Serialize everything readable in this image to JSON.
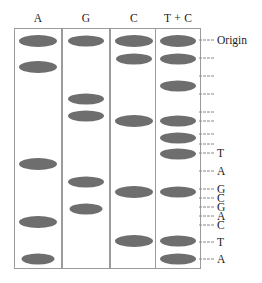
{
  "figure": {
    "type": "dna-sequencing-gel-autoradiogram",
    "band_color": "#6e6e6e",
    "lane_border_color": "#9b9b9b",
    "tick_color": "#8a8a8a",
    "origin_label": "Origin"
  },
  "lanes": [
    {
      "id": "lane-a",
      "header": "A",
      "x": 14,
      "width": 48,
      "bands": [
        {
          "y": 40,
          "w": 38,
          "h": 12
        },
        {
          "y": 66,
          "w": 38,
          "h": 12
        },
        {
          "y": 163,
          "w": 38,
          "h": 12
        },
        {
          "y": 221,
          "w": 38,
          "h": 12
        },
        {
          "y": 258,
          "w": 33,
          "h": 11
        }
      ]
    },
    {
      "id": "lane-g",
      "header": "G",
      "x": 62,
      "width": 48,
      "bands": [
        {
          "y": 40,
          "w": 36,
          "h": 11
        },
        {
          "y": 98,
          "w": 36,
          "h": 11
        },
        {
          "y": 115,
          "w": 36,
          "h": 11
        },
        {
          "y": 181,
          "w": 36,
          "h": 11
        },
        {
          "y": 208,
          "w": 33,
          "h": 11
        }
      ]
    },
    {
      "id": "lane-c",
      "header": "C",
      "x": 110,
      "width": 48,
      "bands": [
        {
          "y": 40,
          "w": 38,
          "h": 12
        },
        {
          "y": 58,
          "w": 36,
          "h": 11
        },
        {
          "y": 120,
          "w": 38,
          "h": 12
        },
        {
          "y": 191,
          "w": 38,
          "h": 12
        },
        {
          "y": 240,
          "w": 38,
          "h": 12
        }
      ]
    },
    {
      "id": "lane-tc",
      "header": "T + C",
      "x": 155,
      "width": 46,
      "bands": [
        {
          "y": 40,
          "w": 36,
          "h": 12
        },
        {
          "y": 58,
          "w": 36,
          "h": 11
        },
        {
          "y": 85,
          "w": 36,
          "h": 11
        },
        {
          "y": 120,
          "w": 36,
          "h": 11
        },
        {
          "y": 137,
          "w": 36,
          "h": 11
        },
        {
          "y": 153,
          "w": 36,
          "h": 11
        },
        {
          "y": 191,
          "w": 36,
          "h": 11
        },
        {
          "y": 240,
          "w": 36,
          "h": 11
        },
        {
          "y": 258,
          "w": 36,
          "h": 11
        }
      ]
    }
  ],
  "ruler": {
    "ticks": [
      {
        "y": 40,
        "label": "Origin"
      },
      {
        "y": 58,
        "label": ""
      },
      {
        "y": 76,
        "label": ""
      },
      {
        "y": 94,
        "label": ""
      },
      {
        "y": 112,
        "label": ""
      },
      {
        "y": 121,
        "label": ""
      },
      {
        "y": 134,
        "label": ""
      },
      {
        "y": 144,
        "label": ""
      },
      {
        "y": 153,
        "label": "T"
      },
      {
        "y": 171,
        "label": "A"
      },
      {
        "y": 189,
        "label": "G"
      },
      {
        "y": 198,
        "label": "C"
      },
      {
        "y": 207,
        "label": "G"
      },
      {
        "y": 216,
        "label": "A"
      },
      {
        "y": 225,
        "label": "C"
      },
      {
        "y": 242,
        "label": "T"
      },
      {
        "y": 259,
        "label": "A"
      }
    ],
    "sequence_read": [
      "T",
      "A",
      "G",
      "C",
      "G",
      "A",
      "C",
      "T",
      "A"
    ]
  }
}
